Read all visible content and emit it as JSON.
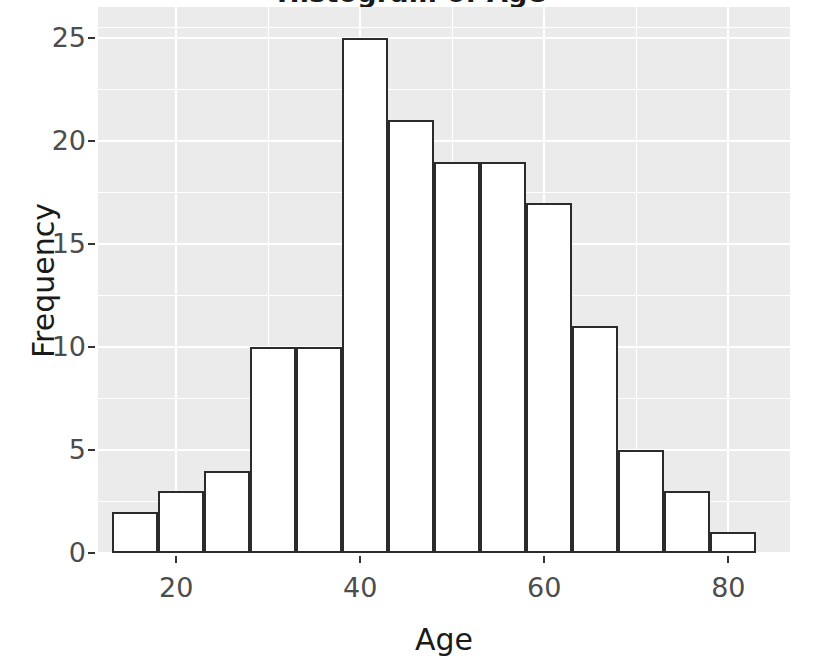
{
  "chart_data": {
    "type": "bar",
    "title": "Histogram of Age",
    "xlabel": "Age",
    "ylabel": "Frequency",
    "xlim": [
      11.5,
      86.7
    ],
    "ylim": [
      0,
      26.5
    ],
    "grid": true,
    "legend": "none",
    "bin_width": 5,
    "bin_edges": [
      13,
      18,
      23,
      28,
      33,
      38,
      43,
      48,
      53,
      58,
      63,
      68,
      73,
      78,
      83
    ],
    "categories": [
      "13-18",
      "18-23",
      "23-28",
      "28-33",
      "33-38",
      "38-43",
      "43-48",
      "48-53",
      "53-58",
      "58-63",
      "63-68",
      "68-73",
      "73-78",
      "78-83"
    ],
    "bin_centers": [
      15.5,
      20.5,
      25.5,
      30.5,
      35.5,
      40.5,
      45.5,
      50.5,
      55.5,
      60.5,
      65.5,
      70.5,
      75.5,
      80.5
    ],
    "values": [
      2,
      3,
      4,
      10,
      10,
      25,
      21,
      19,
      19,
      17,
      11,
      5,
      3,
      1
    ],
    "x_ticks": [
      20,
      40,
      60,
      80
    ],
    "x_tick_labels": [
      "20",
      "40",
      "60",
      "80"
    ],
    "y_ticks": [
      0,
      5,
      10,
      15,
      20,
      25
    ],
    "y_tick_labels": [
      "0",
      "5",
      "10",
      "15",
      "20",
      "25"
    ],
    "y_minor_ticks": [
      2.5,
      7.5,
      12.5,
      17.5,
      22.5,
      25.5
    ],
    "x_minor_ticks": [
      10,
      30,
      50,
      70
    ],
    "colors": {
      "panel_background": "#ebebeb",
      "gridline": "#ffffff",
      "bar_fill": "#ffffff",
      "bar_outline": "#2b2b2b",
      "tick_label": "#4d4d4d",
      "axis_title": "#1a1a1a",
      "figure_background": "#ffffff"
    }
  }
}
